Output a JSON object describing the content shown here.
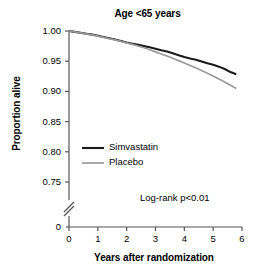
{
  "chart_data": {
    "type": "line",
    "title": "Age <65 years",
    "xlabel": "Years after randomization",
    "ylabel": "Proportion alive",
    "xlim": [
      0,
      6
    ],
    "ylim": [
      0.75,
      1.0
    ],
    "y_axis_break": true,
    "y_origin_label": "0",
    "grid": false,
    "legend_position": "center-left",
    "annotation": "Log-rank p<0.01",
    "xticks": [
      0,
      1,
      2,
      3,
      4,
      5,
      6
    ],
    "xtick_labels": [
      "0",
      "1",
      "2",
      "3",
      "4",
      "5",
      "6"
    ],
    "yticks": [
      0.75,
      0.8,
      0.85,
      0.9,
      0.95,
      1.0
    ],
    "ytick_labels": [
      "0.75",
      "0.80",
      "0.85",
      "0.90",
      "0.95",
      "1.00"
    ],
    "series": [
      {
        "name": "Simvastatin",
        "color": "#1a1a1a",
        "x": [
          0.0,
          0.2,
          0.4,
          0.6,
          0.8,
          1.0,
          1.2,
          1.4,
          1.6,
          1.8,
          2.0,
          2.2,
          2.4,
          2.6,
          2.8,
          3.0,
          3.2,
          3.4,
          3.6,
          3.8,
          4.0,
          4.2,
          4.4,
          4.6,
          4.8,
          5.0,
          5.2,
          5.4,
          5.6,
          5.8
        ],
        "y": [
          1.0,
          0.9985,
          0.997,
          0.9955,
          0.994,
          0.992,
          0.99,
          0.988,
          0.986,
          0.9835,
          0.981,
          0.979,
          0.977,
          0.975,
          0.973,
          0.9705,
          0.968,
          0.966,
          0.963,
          0.96,
          0.957,
          0.9545,
          0.9525,
          0.9495,
          0.9465,
          0.944,
          0.941,
          0.937,
          0.932,
          0.9285
        ]
      },
      {
        "name": "Placebo",
        "color": "#9a9a9a",
        "x": [
          0.0,
          0.2,
          0.4,
          0.6,
          0.8,
          1.0,
          1.2,
          1.4,
          1.6,
          1.8,
          2.0,
          2.2,
          2.4,
          2.6,
          2.8,
          3.0,
          3.2,
          3.4,
          3.6,
          3.8,
          4.0,
          4.2,
          4.4,
          4.6,
          4.8,
          5.0,
          5.2,
          5.4,
          5.6,
          5.8
        ],
        "y": [
          1.0,
          0.9985,
          0.9968,
          0.9952,
          0.9936,
          0.9915,
          0.9895,
          0.9873,
          0.9852,
          0.9828,
          0.9803,
          0.9778,
          0.9752,
          0.9722,
          0.969,
          0.9655,
          0.962,
          0.9585,
          0.9548,
          0.951,
          0.947,
          0.943,
          0.939,
          0.9345,
          0.93,
          0.9255,
          0.9205,
          0.9155,
          0.91,
          0.905
        ]
      }
    ]
  },
  "legend": {
    "items": [
      {
        "label": "Simvastatin",
        "color": "#1a1a1a"
      },
      {
        "label": "Placebo",
        "color": "#9a9a9a"
      }
    ]
  }
}
